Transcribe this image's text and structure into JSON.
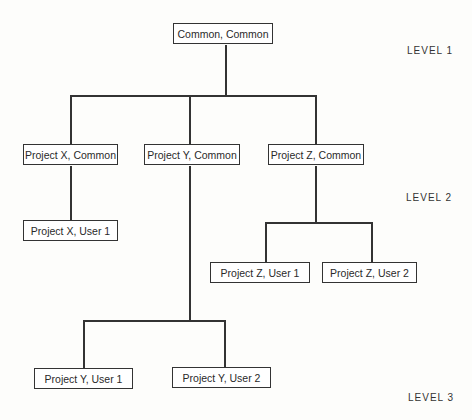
{
  "nodes": {
    "root": "Common, Common",
    "x_common": "Project X, Common",
    "y_common": "Project Y, Common",
    "z_common": "Project Z, Common",
    "x_user1": "Project X, User 1",
    "z_user1": "Project Z, User 1",
    "z_user2": "Project Z, User 2",
    "y_user1": "Project Y, User 1",
    "y_user2": "Project Y, User 2"
  },
  "levels": [
    "LEVEL 1",
    "LEVEL 2",
    "LEVEL 3"
  ]
}
